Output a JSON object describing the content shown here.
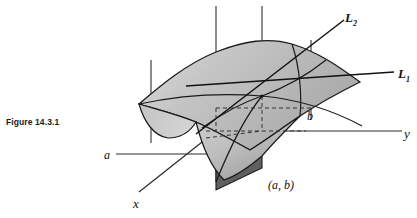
{
  "figure": {
    "caption": "Figure 14.3.1"
  },
  "labels": {
    "line_2": "L",
    "line_2_sub": "2",
    "line_1": "L",
    "line_1_sub": "1",
    "axis_y": "y",
    "axis_x": "x",
    "point_a": "a",
    "point_b": "b",
    "point_ab": "(a, b)"
  },
  "colors": {
    "surface_light": "#c9c9c9",
    "surface_mid": "#b4b4b4",
    "surface_dark": "#8e8e8e",
    "curtain_dark": "#6f6f6f",
    "stroke": "#1a1a1a",
    "axis": "#2a2a2a",
    "background": "#ffffff"
  },
  "geometry": {
    "axis_x_label_pos": "lower-left",
    "axis_y_label_pos": "right",
    "vertical_gridlines": 3,
    "dashed_projection_lines": 4,
    "tangent_point_x": 262,
    "tangent_point_y": 96
  }
}
